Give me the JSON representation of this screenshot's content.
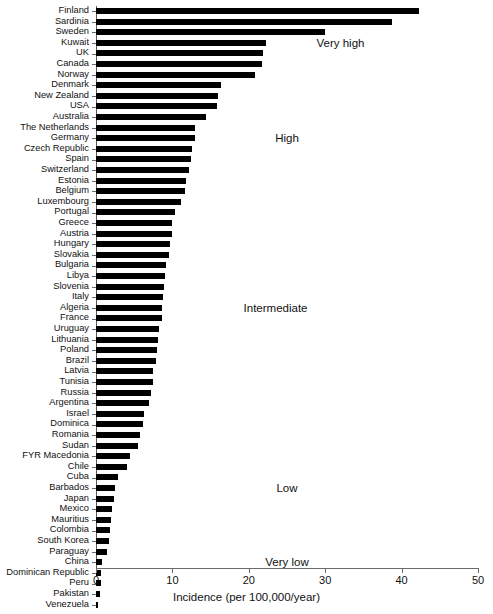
{
  "chart_data": {
    "type": "bar",
    "orientation": "horizontal",
    "title": "",
    "subtitle": "",
    "xlabel": "Incidence (per 100,000/year)",
    "ylabel": "",
    "xlim": [
      0,
      50
    ],
    "xticks": [
      0,
      10,
      20,
      30,
      40,
      50
    ],
    "xtick_labels": [
      "0",
      "10",
      "20",
      "30",
      "40",
      "50"
    ],
    "grid": false,
    "legend": "none",
    "bar_color": "#000000",
    "categories": [
      "Finland",
      "Sardinia",
      "Sweden",
      "Kuwait",
      "UK",
      "Canada",
      "Norway",
      "Denmark",
      "New Zealand",
      "USA",
      "Australia",
      "The Netherlands",
      "Germany",
      "Czech Republic",
      "Spain",
      "Switzerland",
      "Estonia",
      "Belgium",
      "Luxembourg",
      "Portugal",
      "Greece",
      "Austria",
      "Hungary",
      "Slovakia",
      "Bulgaria",
      "Libya",
      "Slovenia",
      "Italy",
      "Algeria",
      "France",
      "Uruguay",
      "Lithuania",
      "Poland",
      "Brazil",
      "Latvia",
      "Tunisia",
      "Russia",
      "Argentina",
      "Israel",
      "Dominica",
      "Romania",
      "Sudan",
      "FYR Macedonia",
      "Chile",
      "Cuba",
      "Barbados",
      "Japan",
      "Mexico",
      "Mauritius",
      "Colombia",
      "South Korea",
      "Paraguay",
      "China",
      "Dominican Republic",
      "Peru",
      "Pakistan",
      "Venezuela"
    ],
    "values": [
      42.3,
      38.7,
      30.0,
      22.3,
      21.9,
      21.7,
      20.8,
      16.4,
      16.0,
      15.8,
      14.4,
      13.0,
      12.9,
      12.5,
      12.4,
      12.2,
      11.8,
      11.6,
      11.1,
      10.3,
      10.0,
      9.9,
      9.7,
      9.6,
      9.2,
      9.0,
      8.9,
      8.8,
      8.7,
      8.6,
      8.3,
      8.1,
      8.0,
      7.8,
      7.5,
      7.4,
      7.2,
      6.9,
      6.3,
      6.1,
      5.8,
      5.5,
      4.5,
      4.0,
      2.9,
      2.5,
      2.4,
      2.1,
      1.9,
      1.8,
      1.7,
      1.4,
      0.8,
      0.7,
      0.6,
      0.5,
      0.3
    ],
    "annotations": [
      {
        "text": "Very high",
        "x": 32.0,
        "category_index": 3
      },
      {
        "text": "High",
        "x": 25.0,
        "category_index": 12
      },
      {
        "text": "Intermediate",
        "x": 23.5,
        "category_index": 28
      },
      {
        "text": "Low",
        "x": 25.0,
        "category_index": 45
      },
      {
        "text": "Very low",
        "x": 25.0,
        "category_index": 52
      }
    ]
  },
  "axis": {
    "x_title": "Incidence (per 100,000/year)"
  }
}
